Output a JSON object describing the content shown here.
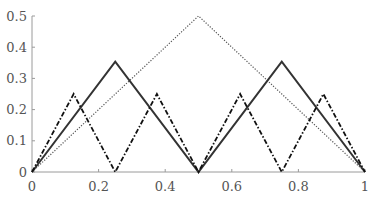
{
  "chart_data": {
    "type": "line",
    "title": "",
    "xlabel": "",
    "ylabel": "",
    "xlim": [
      0,
      1
    ],
    "ylim": [
      0,
      0.5
    ],
    "grid": false,
    "legend": null,
    "x_ticks": [
      0,
      0.2,
      0.4,
      0.6,
      0.8,
      1
    ],
    "x_tick_labels": [
      "0",
      "0.2",
      "0.4",
      "0.6",
      "0.8",
      "1"
    ],
    "y_ticks": [
      0,
      0.1,
      0.2,
      0.3,
      0.4,
      0.5
    ],
    "y_tick_labels": [
      "0",
      "0.1",
      "0.2",
      "0.3",
      "0.4",
      "0.5"
    ],
    "series": [
      {
        "name": "dotted-tent-1",
        "style": "dotted",
        "color": "#555555",
        "x": [
          0,
          0.5,
          1
        ],
        "y": [
          0,
          0.5,
          0
        ]
      },
      {
        "name": "solid-tent-2",
        "style": "solid",
        "color": "#333333",
        "x": [
          0,
          0.25,
          0.5,
          0.75,
          1
        ],
        "y": [
          0,
          0.3536,
          0,
          0.3536,
          0
        ]
      },
      {
        "name": "dashdot-tent-4",
        "style": "dashdot",
        "color": "#111111",
        "x": [
          0,
          0.125,
          0.25,
          0.375,
          0.5,
          0.625,
          0.75,
          0.875,
          1
        ],
        "y": [
          0,
          0.25,
          0,
          0.25,
          0,
          0.25,
          0,
          0.25,
          0
        ]
      }
    ]
  }
}
